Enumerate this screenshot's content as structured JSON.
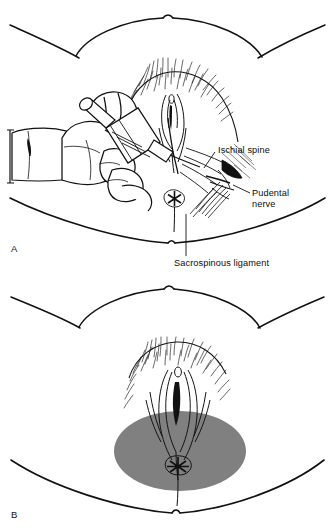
{
  "figure": {
    "style": {
      "line_color": "#111111",
      "shading_color": "#808080",
      "background": "#ffffff"
    },
    "panels": [
      {
        "id": "A",
        "letter": "A",
        "caption": "Transvaginal pudendal nerve block injection with guarded needle",
        "labels": [
          {
            "id": "ischial-spine",
            "text": "Ischial spine"
          },
          {
            "id": "pudendal-nerve",
            "text": "Pudental\nnerve"
          },
          {
            "id": "sacrospinous-ligament",
            "text": "Sacrospinous ligament"
          }
        ]
      },
      {
        "id": "B",
        "letter": "B",
        "caption": "Shaded area of perineal anesthesia achieved by the block",
        "labels": []
      }
    ],
    "label_texts": {
      "ischial_spine": "Ischial spine",
      "pudendal_nerve_line1": "Pudental",
      "pudendal_nerve_line2": "nerve",
      "sacrospinous_ligament": "Sacrospinous ligament"
    }
  }
}
